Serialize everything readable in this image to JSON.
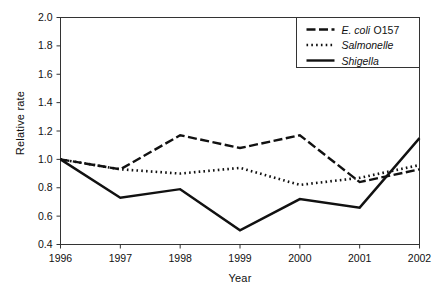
{
  "chart_data": {
    "type": "line",
    "title": "",
    "xlabel": "Year",
    "ylabel": "Relative rate",
    "categories": [
      "1996",
      "1997",
      "1998",
      "1999",
      "2000",
      "2001",
      "2002"
    ],
    "x": [
      1996,
      1997,
      1998,
      1999,
      2000,
      2001,
      2002
    ],
    "xlim": [
      1996,
      2002
    ],
    "ylim": [
      0.4,
      2.0
    ],
    "yticks": [
      "2.0",
      "1.8",
      "1.6",
      "1.4",
      "1.2",
      "1.0",
      "0.8",
      "0.6",
      "0.4"
    ],
    "ytick_values": [
      2.0,
      1.8,
      1.6,
      1.4,
      1.2,
      1.0,
      0.8,
      0.6,
      0.4
    ],
    "grid": false,
    "legend_position": "top-right",
    "series": [
      {
        "name": "E. coli O157",
        "name_italic": "E. coli",
        "name_roman": "O157",
        "style": "dashed",
        "color": "#111111",
        "values": [
          1.0,
          0.93,
          1.17,
          1.08,
          1.17,
          0.84,
          0.93
        ]
      },
      {
        "name": "Salmonelle",
        "name_italic": "Salmonelle",
        "name_roman": "",
        "style": "dotted",
        "color": "#111111",
        "values": [
          1.0,
          0.93,
          0.9,
          0.94,
          0.82,
          0.87,
          0.96
        ]
      },
      {
        "name": "Shigella",
        "name_italic": "Shigella",
        "name_roman": "",
        "style": "solid",
        "color": "#111111",
        "values": [
          1.0,
          0.73,
          0.79,
          0.5,
          0.72,
          0.66,
          1.15
        ]
      }
    ]
  },
  "axes": {
    "y_title": "Relative rate",
    "x_title": "Year"
  }
}
